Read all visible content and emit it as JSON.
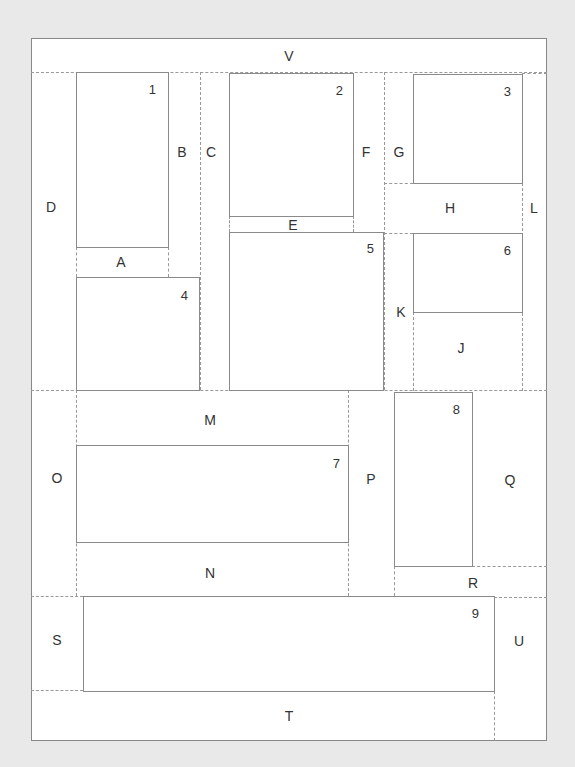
{
  "diagram": {
    "type": "rectangle-packing layout",
    "boxes": [
      {
        "id": "1",
        "label": "1"
      },
      {
        "id": "2",
        "label": "2"
      },
      {
        "id": "3",
        "label": "3"
      },
      {
        "id": "4",
        "label": "4"
      },
      {
        "id": "5",
        "label": "5"
      },
      {
        "id": "6",
        "label": "6"
      },
      {
        "id": "7",
        "label": "7"
      },
      {
        "id": "8",
        "label": "8"
      },
      {
        "id": "9",
        "label": "9"
      }
    ],
    "regions": {
      "A": "A",
      "B": "B",
      "C": "C",
      "D": "D",
      "E": "E",
      "F": "F",
      "G": "G",
      "H": "H",
      "J": "J",
      "K": "K",
      "L": "L",
      "M": "M",
      "N": "N",
      "O": "O",
      "P": "P",
      "Q": "Q",
      "R": "R",
      "S": "S",
      "T": "T",
      "U": "U",
      "V": "V"
    }
  }
}
